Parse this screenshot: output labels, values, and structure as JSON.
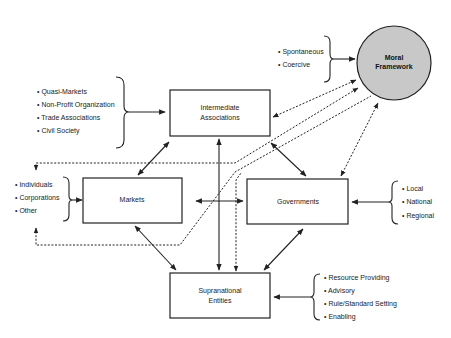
{
  "diagram": {
    "nodes": {
      "moral_framework": {
        "line1": "Moral",
        "line2": "Framework",
        "fill": "#c8c8c8"
      },
      "intermediate": {
        "line1": "Intermediate",
        "line2": "Associations"
      },
      "markets": {
        "line1": "Markets"
      },
      "governments": {
        "line1": "Governments"
      },
      "supranational": {
        "line1": "Supranational",
        "line2": "Entities"
      }
    },
    "lists": {
      "moral_types": [
        "Spontaneous",
        "Coercive"
      ],
      "intermediate_types": [
        "Quasi-Markets",
        "Non-Profit Organization",
        "Trade Associations",
        "Civil Society"
      ],
      "market_actors": [
        "Individuals",
        "Corporations",
        "Other"
      ],
      "government_levels": [
        "Local",
        "National",
        "Regional"
      ],
      "supranational_roles": [
        "Resource Providing",
        "Advisory",
        "Rule/Standard Setting",
        "Enabling"
      ]
    },
    "bullet": "•"
  }
}
